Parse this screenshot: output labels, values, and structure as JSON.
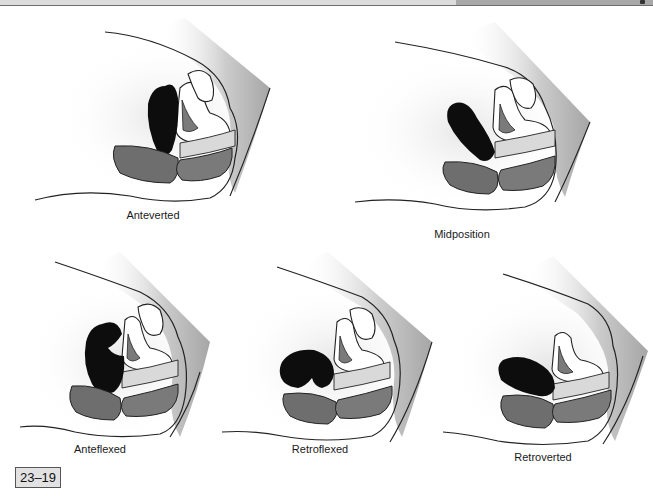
{
  "header": {
    "left_color": "#dcdcdc",
    "right_color": "#a8a8a8",
    "border_color": "#6e6e6e"
  },
  "figure": {
    "number": "23–19",
    "box_fill": "#e2e2e2",
    "box_border": "#555555"
  },
  "colors": {
    "uterus": "#0d0d0d",
    "bladder_wall": "#ffffff",
    "organ_gray": "#6e6e6e",
    "rectum_gray": "#7a7a7a",
    "shadow": "#bdbdbd",
    "outline": "#222222"
  },
  "panels": [
    {
      "id": "anteverted",
      "label": "Anteverted",
      "row": 1,
      "uterus_shape": "upright-oval"
    },
    {
      "id": "midposition",
      "label": "Midposition",
      "row": 1,
      "uterus_shape": "tilted-oval"
    },
    {
      "id": "anteflexed",
      "label": "Anteflexed",
      "row": 2,
      "uterus_shape": "folded-forward"
    },
    {
      "id": "retroflexed",
      "label": "Retroflexed",
      "row": 2,
      "uterus_shape": "folded-backward"
    },
    {
      "id": "retroverted",
      "label": "Retroverted",
      "row": 2,
      "uterus_shape": "horizontal-oval"
    }
  ]
}
